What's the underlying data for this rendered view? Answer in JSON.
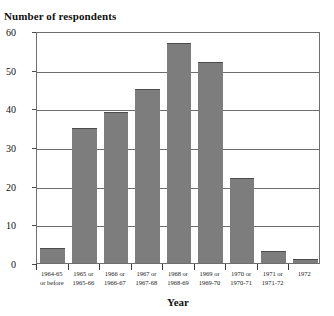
{
  "chart_data": {
    "type": "bar",
    "title": "",
    "ylabel": "Number of respondents",
    "xlabel": "Year",
    "ylim": [
      0,
      60
    ],
    "yticks": [
      0,
      10,
      20,
      30,
      40,
      50,
      60
    ],
    "grid": true,
    "legend": "none",
    "bar_color": "#7d7d7d",
    "categories": [
      "1964-65 or before",
      "1965 or 1965-66",
      "1966 or 1966-67",
      "1967 or 1967-68",
      "1968 or 1968-69",
      "1969 or 1969-70",
      "1970 or 1970-71",
      "1971 or 1971-72",
      "1972"
    ],
    "category_lines": [
      {
        "line1": "1964-65",
        "line2": "or before"
      },
      {
        "line1": "1965 or",
        "line2": "1965-66"
      },
      {
        "line1": "1966 or",
        "line2": "1966-67"
      },
      {
        "line1": "1967 or",
        "line2": "1967-68"
      },
      {
        "line1": "1968 or",
        "line2": "1968-69"
      },
      {
        "line1": "1969 or",
        "line2": "1969-70"
      },
      {
        "line1": "1970 or",
        "line2": "1970-71"
      },
      {
        "line1": "1971 or",
        "line2": "1971-72"
      },
      {
        "line1": "1972",
        "line2": ""
      }
    ],
    "values": [
      4,
      35,
      39,
      45,
      57,
      52,
      22,
      3,
      1
    ]
  }
}
